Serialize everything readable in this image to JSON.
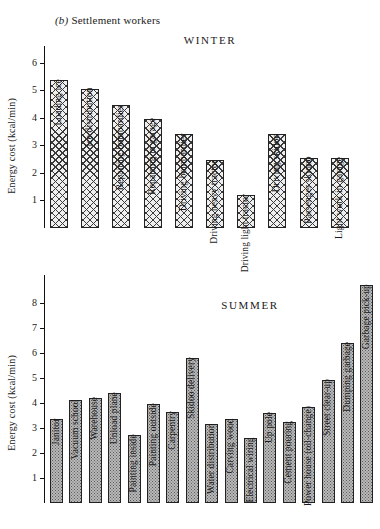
{
  "figure": {
    "caption_prefix": "(b)",
    "caption_text": "Settlement workers"
  },
  "chart_data": [
    {
      "type": "bar",
      "title": "WINTER",
      "xlabel": "",
      "ylabel": "Energy cost (kcal/min)",
      "ylim": [
        0,
        6.6
      ],
      "yticks": [
        1,
        2,
        3,
        4,
        5,
        6
      ],
      "grid": false,
      "legend": "none",
      "fill": "cross-hatch",
      "categories": [
        "Loading ice",
        "Ice distribution",
        "Repairing bombardier",
        "Repairing in garage",
        "Driving bombardier",
        "Driving heavy tractor",
        "Driving light tractor",
        "Driving skidoo",
        "Passenger skidoo",
        "Light work in garage"
      ],
      "values": [
        5.35,
        5.05,
        4.45,
        3.95,
        3.4,
        2.45,
        1.2,
        3.4,
        2.55,
        2.55
      ]
    },
    {
      "type": "bar",
      "title": "SUMMER",
      "xlabel": "",
      "ylabel": "Energy cost (kcal/min)",
      "ylim": [
        0,
        9.1
      ],
      "yticks": [
        1,
        2,
        3,
        4,
        5,
        6,
        7,
        8
      ],
      "grid": false,
      "legend": "none",
      "fill": "stipple",
      "categories": [
        "Janitor",
        "Vacuum school",
        "Warehouse",
        "Unload plane",
        "Painting inside",
        "Painting outside",
        "Carpentry",
        "Skidoo delivery",
        "Water distribution",
        "Carving wood",
        "Electrical wiring",
        "Up pole",
        "Cement pouring",
        "Power house (oil-change)",
        "Street clear-up",
        "Dumping garbage",
        "Garbage pick-up"
      ],
      "values": [
        3.35,
        4.1,
        4.2,
        4.4,
        2.7,
        3.95,
        3.65,
        5.8,
        3.15,
        3.35,
        2.6,
        3.6,
        3.25,
        3.85,
        4.9,
        6.4,
        8.7
      ]
    }
  ]
}
